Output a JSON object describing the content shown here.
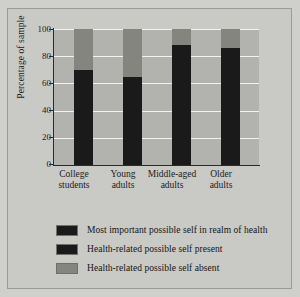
{
  "chart_data": {
    "type": "bar",
    "subtype": "stacked-bar",
    "title": "",
    "xlabel": "",
    "ylabel": "Percentage of sample",
    "ylim": [
      0,
      100
    ],
    "yticks": [
      0,
      20,
      40,
      60,
      80,
      100
    ],
    "ytick_labels": [
      "0",
      "20",
      "40",
      "60",
      "80",
      "100"
    ],
    "grid": true,
    "grid_color": "#f2f2ee",
    "legend_position": "below",
    "categories": [
      "College students",
      "Young adults",
      "Middle-aged adults",
      "Older adults"
    ],
    "category_lines": [
      [
        "College",
        "students"
      ],
      [
        "Young",
        "adults"
      ],
      [
        "Middle-aged",
        "adults"
      ],
      [
        "Older",
        "adults"
      ]
    ],
    "series": [
      {
        "name": "Most important possible self in realm of health",
        "color": "#1a1a1a",
        "values": [
          70,
          65,
          88,
          86
        ]
      },
      {
        "name": "Health-related possible self present",
        "color": "#85857f",
        "values": [
          30,
          35,
          12,
          14
        ]
      },
      {
        "name": "Health-related possible self absent",
        "color": "#b2b2ae",
        "values": [
          0,
          0,
          0,
          0
        ]
      }
    ]
  },
  "legend": {
    "items": [
      {
        "label": "Most important possible self in realm of health",
        "color": "#1a1a1a"
      },
      {
        "label": "Health-related possible self present",
        "color": "#1a1a1a"
      },
      {
        "label": "Health-related possible self absent",
        "color": "#85857f"
      }
    ]
  },
  "axis": {
    "y_title": "Percentage of sample",
    "y_tick_labels": [
      "100",
      "80",
      "60",
      "40",
      "20",
      "0"
    ]
  },
  "colors": {
    "page_background": "#cfcfcc",
    "frame_background": "#c9c9c5",
    "plot_background": "#b2b2ae",
    "gridline": "#f2f2ee",
    "axis": "#2b2b2b",
    "dark_segment": "#1a1a1a",
    "mid_segment": "#85857f",
    "text": "#1c1c1c"
  }
}
